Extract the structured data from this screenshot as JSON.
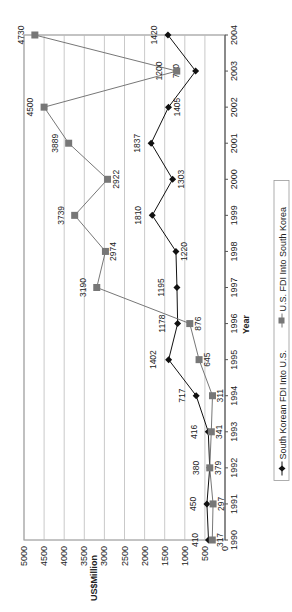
{
  "chart_data": {
    "type": "line",
    "title": "",
    "xlabel": "Year",
    "ylabel": "US$Million",
    "ylim": [
      0,
      5000
    ],
    "yticks": [
      0,
      500,
      1000,
      1500,
      2000,
      2500,
      3000,
      3500,
      4000,
      4500,
      5000
    ],
    "grid": true,
    "legend_position": "bottom",
    "orientation": "rotated 90 degrees clockwise",
    "categories": [
      "1990",
      "1991",
      "1992",
      "1993",
      "1994",
      "1995",
      "1996",
      "1997",
      "1998",
      "1999",
      "2000",
      "2001",
      "2002",
      "2003",
      "2004"
    ],
    "series": [
      {
        "name": "South Korean FDI Into U.S.",
        "marker": "diamond",
        "color": "#111111",
        "values": [
          410,
          450,
          380,
          416,
          717,
          1402,
          1178,
          1195,
          1220,
          1810,
          1303,
          1837,
          1405,
          730,
          1420
        ]
      },
      {
        "name": "U.S. FDI Into South Korea",
        "marker": "square",
        "color": "#777777",
        "values": [
          317,
          297,
          379,
          341,
          311,
          645,
          876,
          3190,
          2974,
          3739,
          2922,
          3889,
          4500,
          1200,
          4730
        ]
      }
    ]
  }
}
